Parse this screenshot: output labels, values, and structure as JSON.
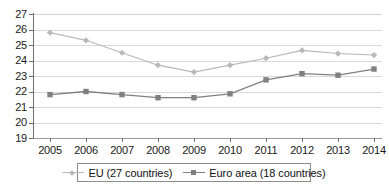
{
  "chart_data": {
    "type": "line",
    "title": "",
    "subtitle": "",
    "xlabel": "",
    "ylabel": "",
    "categories": [
      "2005",
      "2006",
      "2007",
      "2008",
      "2009",
      "2010",
      "2011",
      "2012",
      "2013",
      "2014"
    ],
    "series": [
      {
        "name": "EU (27 countries)",
        "color": "#b8b8b8",
        "marker": "diamond",
        "values": [
          25.8,
          25.3,
          24.5,
          23.7,
          23.25,
          23.7,
          24.15,
          24.65,
          24.45,
          24.35
        ]
      },
      {
        "name": "Euro area (18 countries)",
        "color": "#808080",
        "marker": "square",
        "values": [
          21.8,
          22.0,
          21.8,
          21.6,
          21.6,
          21.85,
          22.75,
          23.15,
          23.05,
          23.45
        ]
      }
    ],
    "ylim": [
      19,
      27
    ],
    "yticks": [
      "19",
      "20",
      "21",
      "22",
      "23",
      "24",
      "25",
      "26",
      "27"
    ],
    "xticks": [
      "2005",
      "2006",
      "2007",
      "2008",
      "2009",
      "2010",
      "2011",
      "2012",
      "2013",
      "2014"
    ],
    "grid": true,
    "grid_color": "#d9d9d9",
    "legend_position": "bottom",
    "axis_color": "#6e6e6e",
    "background": "#ffffff"
  },
  "legend": {
    "entries": [
      {
        "label": "EU (27 countries)"
      },
      {
        "label": "Euro area (18 countries)"
      }
    ]
  }
}
